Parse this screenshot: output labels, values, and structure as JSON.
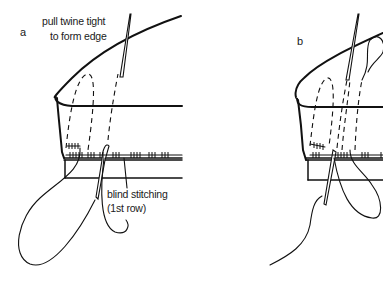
{
  "figure": {
    "panels": [
      {
        "id": "a",
        "label": "a",
        "annotations": {
          "top_line1": "pull twine tight",
          "top_line2": "to form edge",
          "bottom_line1": "blind stitching",
          "bottom_line2": "(1st row)"
        }
      },
      {
        "id": "b",
        "label": "b"
      }
    ],
    "colors": {
      "ink": "#111111",
      "background": "#ffffff"
    }
  }
}
